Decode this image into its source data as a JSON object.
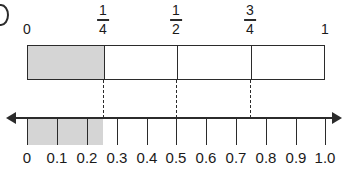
{
  "figure": {
    "crop_glyph": "partial-letter-left-edge",
    "bar_model": {
      "endpoint_labels": [
        {
          "text": "0",
          "value": 0
        },
        {
          "text": "1",
          "value": 1
        }
      ],
      "fraction_labels": [
        {
          "numerator": "1",
          "denominator": "4",
          "value": 0.25
        },
        {
          "numerator": "1",
          "denominator": "2",
          "value": 0.5
        },
        {
          "numerator": "3",
          "denominator": "4",
          "value": 0.75
        }
      ],
      "divisions": 4,
      "shaded_fraction": "1/4",
      "shaded_start": 0,
      "shaded_end": 0.25,
      "divider_values": [
        0.25,
        0.5,
        0.75
      ]
    },
    "number_line": {
      "min": 0,
      "max": 1.0,
      "tick_step": 0.1,
      "tick_labels": [
        "0",
        "0.1",
        "0.2",
        "0.3",
        "0.4",
        "0.5",
        "0.6",
        "0.7",
        "0.8",
        "0.9",
        "1.0"
      ],
      "tick_values": [
        0,
        0.1,
        0.2,
        0.3,
        0.4,
        0.5,
        0.6,
        0.7,
        0.8,
        0.9,
        1.0
      ],
      "shaded_start": 0,
      "shaded_end": 0.25,
      "left_arrow": "arrow-left",
      "right_arrow": "arrow-right",
      "dashed_connector_values": [
        0.25,
        0.5,
        0.75
      ]
    },
    "colors": {
      "shading": "#d5d5d5",
      "stroke": "#2b2b2b",
      "background": "#ffffff"
    }
  }
}
